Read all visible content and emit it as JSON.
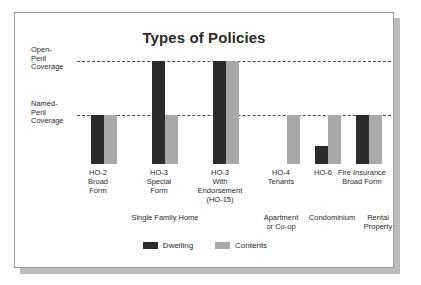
{
  "card": {
    "border_color": "#9a9a9a",
    "shadow_color": "#bcbcbc",
    "background": "#ffffff"
  },
  "chart_data": {
    "type": "bar",
    "title": "Types of Policies",
    "xlabel": "",
    "ylabel": "",
    "grid": false,
    "legend_position": "bottom",
    "value_scale": {
      "baseline": "None",
      "named_peril": "Named-Peril Coverage",
      "open_peril": "Open-Peril Coverage"
    },
    "reference_lines": [
      {
        "id": "open-peril",
        "label": "Open-\nPeril\nCoverage",
        "label_line1": "Open-",
        "label_line2": "Peril",
        "label_line3": "Coverage",
        "value": 2,
        "style": "dashed"
      },
      {
        "id": "named-peril",
        "label": "Named-\nPeril\nCoverage",
        "label_line1": "Named-",
        "label_line2": "Peril",
        "label_line3": "Coverage",
        "value": 1,
        "style": "dashed"
      }
    ],
    "categories": [
      "HO-2 Broad Form",
      "HO-3 Special Form",
      "HO-3 With Endorsement (HO-15)",
      "HO-4 Tenants",
      "HO-6",
      "Fire Insurance Broad Form"
    ],
    "series": [
      {
        "name": "Dwelling",
        "color": "#2c2c2c",
        "values": [
          1,
          2,
          2,
          0,
          0.35,
          1
        ]
      },
      {
        "name": "Contents",
        "color": "#a8a8a8",
        "values": [
          1,
          1,
          2,
          1,
          1,
          1
        ]
      }
    ],
    "groups": [
      {
        "label": "Single Family Home",
        "label_line1": "Single Family Home",
        "categories": [
          0,
          1,
          2
        ]
      },
      {
        "label": "Apartment or Co-op",
        "label_line1": "Apartment",
        "label_line2": "or Co-op",
        "categories": [
          3
        ]
      },
      {
        "label": "Condominium",
        "label_line1": "Condominium",
        "categories": [
          4
        ]
      },
      {
        "label": "Rental Property",
        "label_line1": "Rental",
        "label_line2": "Property",
        "categories": [
          5
        ]
      }
    ]
  },
  "bars": [
    {
      "name": "ho-2-broad-form",
      "x": 76,
      "dwelling_h": 49,
      "contents_h": 49
    },
    {
      "name": "ho-3-special-form",
      "x": 137,
      "dwelling_h": 103,
      "contents_h": 49
    },
    {
      "name": "ho-3-endorsement",
      "x": 198,
      "dwelling_h": 103,
      "contents_h": 103
    },
    {
      "name": "ho-4-tenants",
      "x": 259,
      "dwelling_h": 0,
      "contents_h": 49
    },
    {
      "name": "ho-6",
      "x": 300,
      "dwelling_h": 18,
      "contents_h": 49
    },
    {
      "name": "fire-insurance",
      "x": 341,
      "dwelling_h": 49,
      "contents_h": 49
    }
  ],
  "cat_labels": [
    {
      "name": "ho-2-broad-form",
      "left": 58,
      "width": 50,
      "line1": "HO-2",
      "line2": "Broad",
      "line3": "Form",
      "line4": ""
    },
    {
      "name": "ho-3-special-form",
      "left": 119,
      "width": 50,
      "line1": "HO-3",
      "line2": "Special",
      "line3": "Form",
      "line4": ""
    },
    {
      "name": "ho-3-endorsement",
      "left": 172,
      "width": 66,
      "line1": "HO-3",
      "line2": "With",
      "line3": "Endorsement",
      "line4": "(HO-15)"
    },
    {
      "name": "ho-4-tenants",
      "left": 241,
      "width": 50,
      "line1": "HO-4",
      "line2": "Tenants",
      "line3": "",
      "line4": ""
    },
    {
      "name": "ho-6",
      "left": 283,
      "width": 50,
      "line1": "HO-6",
      "line2": "",
      "line3": "",
      "line4": ""
    },
    {
      "name": "fire-insurance",
      "left": 315,
      "width": 64,
      "line1": "Fire Insurance",
      "line2": "Broad Form",
      "line3": "",
      "line4": ""
    }
  ],
  "group_labels": [
    {
      "name": "single-family-home",
      "left": 66,
      "width": 168,
      "line1": "Single Family Home",
      "line2": ""
    },
    {
      "name": "apartment-or-co-op",
      "left": 237,
      "width": 58,
      "line1": "Apartment",
      "line2": "or Co-op"
    },
    {
      "name": "condominium",
      "left": 286,
      "width": 62,
      "line1": "Condominium",
      "line2": ""
    },
    {
      "name": "rental-property",
      "left": 339,
      "width": 48,
      "line1": "Rental",
      "line2": "Property"
    }
  ],
  "legend": {
    "items": [
      {
        "name": "dwelling",
        "label": "Dwelling",
        "color": "#2c2c2c"
      },
      {
        "name": "contents",
        "label": "Contents",
        "color": "#a8a8a8"
      }
    ]
  }
}
